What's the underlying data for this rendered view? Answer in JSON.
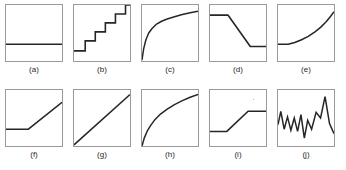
{
  "figure": {
    "title": "",
    "background_color": "#ffffff",
    "line_color": "#262626",
    "frame_color": "#9a9a9a",
    "rows": 2,
    "columns": 5
  },
  "chart_data": {
    "type": "line",
    "title": "",
    "xlabel": "",
    "ylabel": "",
    "xlim": [
      0,
      1
    ],
    "ylim": [
      0,
      1
    ],
    "grid": false,
    "legend": "none",
    "layout": "2 rows x 5 columns of small multiples",
    "panels": [
      {
        "label": "(a)",
        "shape": "constant",
        "description": "flat horizontal line at constant level",
        "x": [
          0.0,
          0.08,
          0.2,
          0.4,
          0.6,
          0.8,
          0.94,
          1.0
        ],
        "y": [
          0.3,
          0.3,
          0.3,
          0.3,
          0.3,
          0.3,
          0.3,
          0.3
        ],
        "x_start": 0.0,
        "x_end": 0.94
      },
      {
        "label": "(b)",
        "shape": "staircase",
        "description": "ascending step function with four risers",
        "x": [
          0.0,
          0.2,
          0.2,
          0.38,
          0.38,
          0.56,
          0.56,
          0.74,
          0.74,
          0.92,
          0.92,
          1.0
        ],
        "y": [
          0.18,
          0.18,
          0.36,
          0.36,
          0.52,
          0.52,
          0.68,
          0.68,
          0.84,
          0.84,
          1.0,
          1.0
        ],
        "steps": 5
      },
      {
        "label": "(c)",
        "shape": "concave-increasing",
        "description": "sharply rising then saturating logarithmic curve",
        "x": [
          0.0,
          0.03,
          0.07,
          0.12,
          0.18,
          0.26,
          0.35,
          0.45,
          0.58,
          0.72,
          0.86,
          1.0
        ],
        "y": [
          0.02,
          0.22,
          0.38,
          0.5,
          0.58,
          0.66,
          0.71,
          0.75,
          0.79,
          0.83,
          0.86,
          0.89
        ]
      },
      {
        "label": "(d)",
        "shape": "descending-step",
        "description": "high plateau, linear decline, low plateau",
        "x": [
          0.0,
          0.32,
          0.72,
          1.0
        ],
        "y": [
          0.82,
          0.82,
          0.26,
          0.26
        ]
      },
      {
        "label": "(e)",
        "shape": "convex-increasing",
        "description": "flat then exponentially accelerating rise",
        "x": [
          0.0,
          0.18,
          0.3,
          0.42,
          0.54,
          0.66,
          0.76,
          0.86,
          0.94,
          1.0
        ],
        "y": [
          0.3,
          0.3,
          0.33,
          0.38,
          0.44,
          0.52,
          0.6,
          0.7,
          0.8,
          0.88
        ]
      },
      {
        "label": "(f)",
        "shape": "hinge-increasing",
        "description": "flat segment then straight-line rise (hockey stick)",
        "x": [
          0.0,
          0.4,
          1.0
        ],
        "y": [
          0.3,
          0.3,
          0.78
        ]
      },
      {
        "label": "(g)",
        "shape": "linear-increasing",
        "description": "straight diagonal line from bottom-left to top-right",
        "x": [
          0.0,
          1.0
        ],
        "y": [
          0.02,
          0.92
        ]
      },
      {
        "label": "(h)",
        "shape": "concave-increasing",
        "description": "square-root style curve rising from origin",
        "x": [
          0.0,
          0.04,
          0.09,
          0.15,
          0.23,
          0.33,
          0.45,
          0.58,
          0.72,
          0.86,
          1.0
        ],
        "y": [
          0.0,
          0.14,
          0.26,
          0.36,
          0.47,
          0.57,
          0.66,
          0.74,
          0.81,
          0.87,
          0.92
        ]
      },
      {
        "label": "(i)",
        "shape": "ascending-step",
        "description": "low plateau, linear rise, high plateau",
        "x": [
          0.0,
          0.3,
          0.68,
          1.0
        ],
        "y": [
          0.26,
          0.26,
          0.62,
          0.62
        ]
      },
      {
        "label": "(j)",
        "shape": "zigzag-noisy",
        "description": "oscillating noisy series with increasing amplitude peak near right",
        "x": [
          0.0,
          0.05,
          0.11,
          0.17,
          0.23,
          0.29,
          0.35,
          0.41,
          0.47,
          0.53,
          0.6,
          0.68,
          0.76,
          0.84,
          0.92,
          1.0
        ],
        "y": [
          0.38,
          0.62,
          0.3,
          0.52,
          0.28,
          0.5,
          0.26,
          0.56,
          0.14,
          0.46,
          0.3,
          0.6,
          0.5,
          0.88,
          0.4,
          0.22
        ]
      }
    ]
  }
}
